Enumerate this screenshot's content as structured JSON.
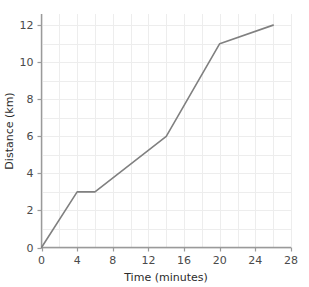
{
  "chart_data": {
    "type": "line",
    "title": "",
    "xlabel": "Time (minutes)",
    "ylabel": "Distance (km)",
    "xlim": [
      0,
      28
    ],
    "ylim": [
      0,
      12.6
    ],
    "xticks": [
      0,
      4,
      8,
      12,
      16,
      20,
      24,
      28
    ],
    "xtick_labels": [
      "0",
      "4",
      "8",
      "12",
      "16",
      "20",
      "24",
      "28"
    ],
    "yticks": [
      0,
      2,
      4,
      6,
      8,
      10,
      12
    ],
    "ytick_labels": [
      "0",
      "2",
      "4",
      "6",
      "8",
      "10",
      "12"
    ],
    "grid": true,
    "grid_x_step": 2,
    "grid_y_step": 1,
    "legend": "none",
    "series": [
      {
        "name": "Distance travelled",
        "x": [
          0,
          4,
          6,
          14,
          20,
          26
        ],
        "y": [
          0,
          3,
          3,
          6,
          11,
          12
        ],
        "color": "#808080",
        "line_width": 1.6,
        "markers": "none"
      }
    ],
    "colors": {
      "line": "#808080",
      "axis": "#9a9a9a",
      "grid": "#ededed",
      "tick_text": "#4a4a4a",
      "axis_title_text": "#2b2b2b",
      "background": "#ffffff"
    }
  }
}
